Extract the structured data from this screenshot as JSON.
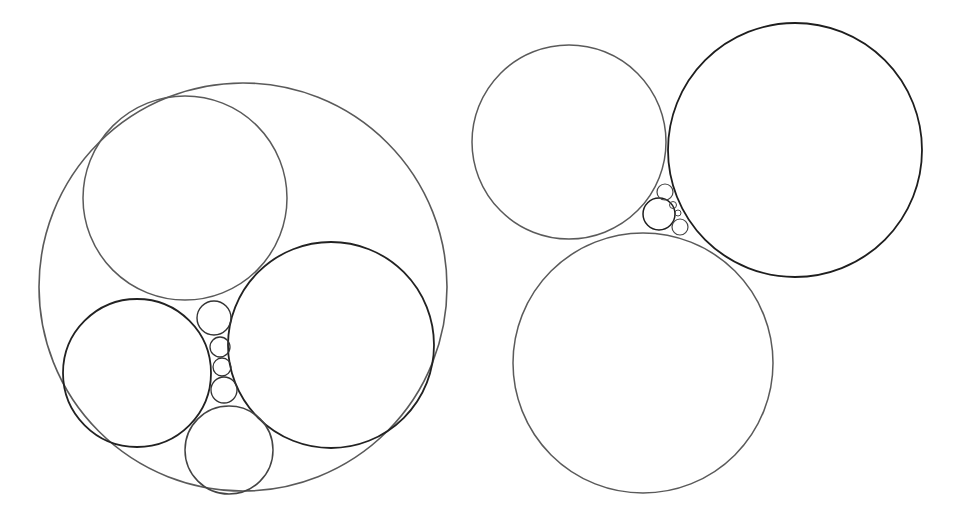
{
  "canvas": {
    "width": 957,
    "height": 514,
    "background": "#ffffff"
  },
  "figures": [
    {
      "name": "left-figure-enclosed-packing",
      "circles": [
        {
          "id": "outer",
          "cx": 243,
          "cy": 287,
          "r": 204,
          "stroke": "#5a5a5a",
          "width": 1.6
        },
        {
          "id": "top",
          "cx": 185,
          "cy": 198,
          "r": 102,
          "stroke": "#5a5a5a",
          "width": 1.5
        },
        {
          "id": "right-large",
          "cx": 331,
          "cy": 345,
          "r": 103,
          "stroke": "#222222",
          "width": 1.8
        },
        {
          "id": "left-mid",
          "cx": 137,
          "cy": 373,
          "r": 74,
          "stroke": "#222222",
          "width": 1.8
        },
        {
          "id": "bottom",
          "cx": 229,
          "cy": 450,
          "r": 44,
          "stroke": "#444444",
          "width": 1.5
        },
        {
          "id": "chain-1",
          "cx": 214,
          "cy": 318,
          "r": 17,
          "stroke": "#333333",
          "width": 1.4
        },
        {
          "id": "chain-2",
          "cx": 220,
          "cy": 347,
          "r": 10,
          "stroke": "#333333",
          "width": 1.3
        },
        {
          "id": "chain-3",
          "cx": 222,
          "cy": 367,
          "r": 9,
          "stroke": "#333333",
          "width": 1.3
        },
        {
          "id": "chain-4",
          "cx": 224,
          "cy": 390,
          "r": 13,
          "stroke": "#333333",
          "width": 1.3
        }
      ]
    },
    {
      "name": "right-figure-three-tangent",
      "circles": [
        {
          "id": "top-left",
          "cx": 569,
          "cy": 142,
          "r": 97,
          "stroke": "#5a5a5a",
          "width": 1.5
        },
        {
          "id": "top-right",
          "cx": 795,
          "cy": 150,
          "r": 127,
          "stroke": "#1e1e1e",
          "width": 1.8
        },
        {
          "id": "bottom",
          "cx": 643,
          "cy": 363,
          "r": 130,
          "stroke": "#5a5a5a",
          "width": 1.5
        },
        {
          "id": "gap-large",
          "cx": 659,
          "cy": 214,
          "r": 16,
          "stroke": "#1e1e1e",
          "width": 1.5
        },
        {
          "id": "gap-top",
          "cx": 665,
          "cy": 192,
          "r": 8,
          "stroke": "#444444",
          "width": 1.2
        },
        {
          "id": "gap-bottom",
          "cx": 680,
          "cy": 227,
          "r": 8,
          "stroke": "#444444",
          "width": 1.2
        },
        {
          "id": "gap-tiny-1",
          "cx": 673,
          "cy": 205,
          "r": 3.5,
          "stroke": "#444444",
          "width": 1.0
        },
        {
          "id": "gap-tiny-2",
          "cx": 678,
          "cy": 213,
          "r": 3,
          "stroke": "#444444",
          "width": 1.0
        }
      ]
    }
  ]
}
